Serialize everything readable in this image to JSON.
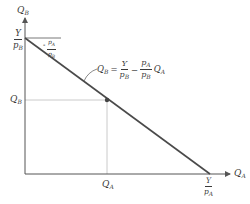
{
  "diagram": {
    "type": "budget-constraint",
    "colors": {
      "axes": "#555555",
      "budget_line": "#4a4a4a",
      "guide_lines": "#bdbdbd",
      "point": "#444444",
      "text": "#3a3a3a"
    },
    "axes": {
      "y_label": {
        "base": "Q",
        "sub": "B"
      },
      "x_label": {
        "base": "Q",
        "sub": "A"
      }
    },
    "y_intercept": {
      "num": "Y",
      "den_base": "p",
      "den_sub": "B"
    },
    "x_intercept": {
      "num": "Y",
      "den_base": "p",
      "den_sub": "A"
    },
    "slope_label": {
      "sign": "-",
      "num_base": "p",
      "num_sub": "A",
      "den_base": "p",
      "den_sub": "B"
    },
    "point": {
      "y_label": {
        "base": "Q",
        "sub": "B"
      },
      "x_label": {
        "base": "Q",
        "sub": "A"
      }
    },
    "equation": {
      "lhs_base": "Q",
      "lhs_sub": "B",
      "equals": "=",
      "term1_num": "Y",
      "term1_den_base": "p",
      "term1_den_sub": "B",
      "minus": "−",
      "term2_num_base": "p",
      "term2_num_sub": "A",
      "term2_den_base": "p",
      "term2_den_sub": "B",
      "term2_var_base": "Q",
      "term2_var_sub": "A"
    }
  }
}
